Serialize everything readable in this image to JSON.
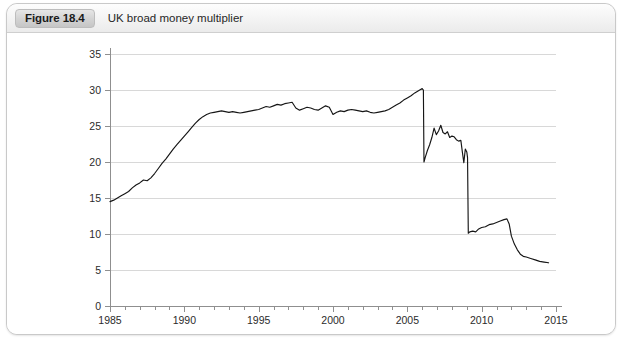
{
  "figure": {
    "badge": "Figure 18.4",
    "title": "UK broad money multiplier"
  },
  "chart_data": {
    "type": "line",
    "title": "UK broad money multiplier",
    "xlabel": "",
    "ylabel": "",
    "xlim": [
      1985,
      2015
    ],
    "ylim": [
      0,
      35
    ],
    "ytick_labels": [
      "0",
      "5",
      "10",
      "15",
      "20",
      "25",
      "30",
      "35"
    ],
    "yticks": [
      0,
      5,
      10,
      15,
      20,
      25,
      30,
      35
    ],
    "xtick_labels": [
      "1985",
      "1990",
      "1995",
      "2000",
      "2005",
      "2010",
      "2015"
    ],
    "xticks": [
      1985,
      1990,
      1995,
      2000,
      2005,
      2010,
      2015
    ],
    "x_minor_tick_interval": 1,
    "grid": "horizontal",
    "legend": "none",
    "series": [
      {
        "name": "UK broad money multiplier",
        "color": "#161616",
        "x": [
          1985.0,
          1985.25,
          1985.5,
          1985.75,
          1986.0,
          1986.25,
          1986.5,
          1986.75,
          1987.0,
          1987.25,
          1987.5,
          1987.75,
          1988.0,
          1988.25,
          1988.5,
          1988.75,
          1989.0,
          1989.25,
          1989.5,
          1989.75,
          1990.0,
          1990.25,
          1990.5,
          1990.75,
          1991.0,
          1991.25,
          1991.5,
          1991.75,
          1992.0,
          1992.25,
          1992.5,
          1992.75,
          1993.0,
          1993.25,
          1993.5,
          1993.75,
          1994.0,
          1994.25,
          1994.5,
          1994.75,
          1995.0,
          1995.25,
          1995.5,
          1995.75,
          1996.0,
          1996.25,
          1996.5,
          1996.75,
          1997.0,
          1997.25,
          1997.5,
          1997.75,
          1998.0,
          1998.25,
          1998.5,
          1998.75,
          1999.0,
          1999.25,
          1999.5,
          1999.75,
          2000.0,
          2000.25,
          2000.5,
          2000.75,
          2001.0,
          2001.25,
          2001.5,
          2001.75,
          2002.0,
          2002.25,
          2002.5,
          2002.75,
          2003.0,
          2003.25,
          2003.5,
          2003.75,
          2004.0,
          2004.25,
          2004.5,
          2004.75,
          2005.0,
          2005.25,
          2005.5,
          2005.75,
          2006.0,
          2006.08,
          2006.12,
          2006.2,
          2006.35,
          2006.5,
          2006.65,
          2006.8,
          2006.95,
          2007.1,
          2007.25,
          2007.4,
          2007.55,
          2007.7,
          2007.85,
          2008.0,
          2008.15,
          2008.3,
          2008.45,
          2008.6,
          2008.7,
          2008.8,
          2008.9,
          2009.0,
          2009.05,
          2009.1,
          2009.2,
          2009.4,
          2009.6,
          2009.8,
          2010.0,
          2010.25,
          2010.5,
          2010.75,
          2011.0,
          2011.25,
          2011.5,
          2011.7,
          2011.85,
          2012.0,
          2012.2,
          2012.4,
          2012.6,
          2012.8,
          2013.0,
          2013.3,
          2013.6,
          2013.9,
          2014.2,
          2014.5
        ],
        "y": [
          14.5,
          14.7,
          15.0,
          15.3,
          15.6,
          15.9,
          16.4,
          16.8,
          17.1,
          17.5,
          17.4,
          17.8,
          18.4,
          19.1,
          19.8,
          20.4,
          21.1,
          21.8,
          22.4,
          23.0,
          23.6,
          24.2,
          24.8,
          25.4,
          25.9,
          26.3,
          26.6,
          26.8,
          26.9,
          27.0,
          27.1,
          27.0,
          26.9,
          27.0,
          26.9,
          26.8,
          26.9,
          27.0,
          27.1,
          27.2,
          27.3,
          27.5,
          27.7,
          27.6,
          27.8,
          28.0,
          27.9,
          28.1,
          28.2,
          28.3,
          27.5,
          27.2,
          27.4,
          27.6,
          27.5,
          27.3,
          27.2,
          27.5,
          27.8,
          27.6,
          26.6,
          26.9,
          27.1,
          27.0,
          27.2,
          27.3,
          27.2,
          27.1,
          27.0,
          27.1,
          26.9,
          26.8,
          26.9,
          27.0,
          27.1,
          27.3,
          27.6,
          27.9,
          28.2,
          28.6,
          28.9,
          29.2,
          29.6,
          29.9,
          30.2,
          30.0,
          20.0,
          20.6,
          21.6,
          22.4,
          23.4,
          24.7,
          23.8,
          24.3,
          25.1,
          24.1,
          23.9,
          24.2,
          23.4,
          23.6,
          23.5,
          23.1,
          22.9,
          23.0,
          21.4,
          19.9,
          21.8,
          21.4,
          20.6,
          10.1,
          10.3,
          10.4,
          10.3,
          10.7,
          10.9,
          11.0,
          11.3,
          11.4,
          11.6,
          11.8,
          12.0,
          12.1,
          11.4,
          9.7,
          8.6,
          7.8,
          7.2,
          6.9,
          6.8,
          6.6,
          6.4,
          6.2,
          6.1,
          6.0
        ]
      }
    ]
  }
}
